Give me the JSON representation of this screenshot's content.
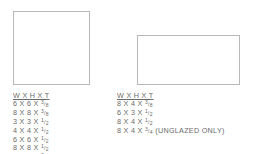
{
  "tiles": [
    {
      "name": "square-tile",
      "header": "W X H X T",
      "sizes": [
        {
          "dims": "6 X 6 X",
          "num": "3",
          "den": "8",
          "note": ""
        },
        {
          "dims": "8 X 8 X",
          "num": "3",
          "den": "8",
          "note": ""
        },
        {
          "dims": "3 X 3 X",
          "num": "1",
          "den": "2",
          "note": ""
        },
        {
          "dims": "4 X 4 X",
          "num": "1",
          "den": "2",
          "note": ""
        },
        {
          "dims": "6 X 6 X",
          "num": "1",
          "den": "2",
          "note": ""
        },
        {
          "dims": "8 X 8 X",
          "num": "1",
          "den": "2",
          "note": ""
        },
        {
          "dims": "6 X 6 X",
          "num": "3",
          "den": "4",
          "note": ""
        }
      ]
    },
    {
      "name": "rectangle-tile",
      "header": "W X H X T",
      "sizes": [
        {
          "dims": "8 X 4 X",
          "num": "3",
          "den": "8",
          "note": ""
        },
        {
          "dims": "6 X 3 X",
          "num": "1",
          "den": "2",
          "note": ""
        },
        {
          "dims": "8 X 4 X",
          "num": "1",
          "den": "2",
          "note": ""
        },
        {
          "dims": "8 X 4 X",
          "num": "3",
          "den": "4",
          "note": "(UNGLAZED ONLY)"
        }
      ]
    }
  ]
}
